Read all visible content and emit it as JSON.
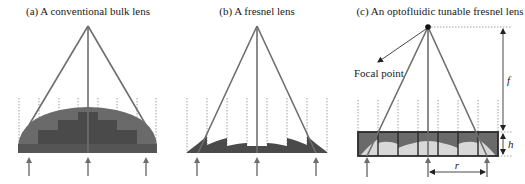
{
  "figure": {
    "panels": [
      {
        "id": "a",
        "title": "(a) A conventional bulk lens"
      },
      {
        "id": "b",
        "title": "(b) A fresnel lens"
      },
      {
        "id": "c",
        "title": "(c) An optofluidic tunable fresnel lens"
      }
    ],
    "annotations": {
      "focal_point_label": "Focal point",
      "focal_length_label": "f",
      "height_label": "h",
      "radius_label": "r"
    },
    "colors": {
      "lens_dark": "#4a4a4a",
      "lens_mid": "#6a6a6a",
      "lens_light": "#d8d8d8",
      "ray": "#6e6e6e",
      "background": "#ffffff"
    }
  }
}
